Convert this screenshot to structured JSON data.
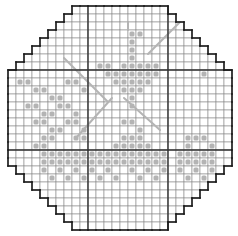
{
  "pattern": {
    "title": "Cross-stitch chart",
    "origin_x": 8,
    "origin_y": 6,
    "cell_size": 8,
    "cols": 28,
    "rows": 28,
    "corner_steps": 8,
    "major_cols": [
      10,
      20
    ],
    "major_rows": [
      8,
      18
    ],
    "colors": {
      "background": "#ffffff",
      "grid": "#8a8a8a",
      "major_grid": "#333333",
      "outline": "#1a1a1a",
      "stitch": "#b4b4b4"
    },
    "full_stitches": [
      [
        15,
        3
      ],
      [
        15,
        4
      ],
      [
        15,
        5
      ],
      [
        15,
        6
      ],
      [
        14,
        7
      ],
      [
        15,
        7
      ],
      [
        16,
        7
      ],
      [
        12,
        8
      ],
      [
        13,
        8
      ],
      [
        14,
        8
      ],
      [
        15,
        8
      ],
      [
        16,
        8
      ],
      [
        17,
        8
      ],
      [
        18,
        8
      ],
      [
        13,
        9
      ],
      [
        14,
        9
      ],
      [
        15,
        9
      ],
      [
        16,
        9
      ],
      [
        17,
        9
      ],
      [
        14,
        10
      ],
      [
        15,
        10
      ],
      [
        16,
        10
      ],
      [
        15,
        11
      ],
      [
        15,
        12
      ],
      [
        17,
        7
      ],
      [
        18,
        7
      ],
      [
        12,
        7
      ],
      [
        11,
        7
      ],
      [
        1,
        9
      ],
      [
        2,
        9
      ],
      [
        3,
        10
      ],
      [
        4,
        10
      ],
      [
        7,
        9
      ],
      [
        8,
        9
      ],
      [
        9,
        10
      ],
      [
        5,
        11
      ],
      [
        6,
        11
      ],
      [
        2,
        12
      ],
      [
        3,
        12
      ],
      [
        4,
        13
      ],
      [
        5,
        13
      ],
      [
        6,
        12
      ],
      [
        7,
        12
      ],
      [
        8,
        13
      ],
      [
        3,
        14
      ],
      [
        4,
        14
      ],
      [
        5,
        15
      ],
      [
        6,
        15
      ],
      [
        7,
        14
      ],
      [
        8,
        14
      ],
      [
        9,
        15
      ],
      [
        4,
        16
      ],
      [
        5,
        16
      ],
      [
        3,
        17
      ],
      [
        4,
        17
      ],
      [
        8,
        16
      ],
      [
        9,
        16
      ],
      [
        4,
        18
      ],
      [
        5,
        18
      ],
      [
        6,
        18
      ],
      [
        7,
        18
      ],
      [
        8,
        18
      ],
      [
        9,
        18
      ],
      [
        10,
        18
      ],
      [
        11,
        18
      ],
      [
        12,
        18
      ],
      [
        13,
        18
      ],
      [
        4,
        19
      ],
      [
        5,
        19
      ],
      [
        6,
        19
      ],
      [
        7,
        19
      ],
      [
        8,
        19
      ],
      [
        9,
        19
      ],
      [
        10,
        19
      ],
      [
        11,
        19
      ],
      [
        12,
        19
      ],
      [
        13,
        19
      ],
      [
        4,
        20
      ],
      [
        6,
        20
      ],
      [
        8,
        20
      ],
      [
        10,
        20
      ],
      [
        12,
        20
      ],
      [
        5,
        21
      ],
      [
        7,
        21
      ],
      [
        9,
        21
      ],
      [
        11,
        21
      ],
      [
        13,
        21
      ],
      [
        14,
        14
      ],
      [
        15,
        14
      ],
      [
        16,
        15
      ],
      [
        14,
        16
      ],
      [
        15,
        16
      ],
      [
        16,
        16
      ],
      [
        13,
        17
      ],
      [
        14,
        17
      ],
      [
        15,
        17
      ],
      [
        16,
        17
      ],
      [
        17,
        17
      ],
      [
        14,
        18
      ],
      [
        15,
        18
      ],
      [
        16,
        18
      ],
      [
        17,
        18
      ],
      [
        18,
        18
      ],
      [
        19,
        18
      ],
      [
        14,
        19
      ],
      [
        15,
        19
      ],
      [
        16,
        19
      ],
      [
        17,
        19
      ],
      [
        18,
        19
      ],
      [
        19,
        19
      ],
      [
        15,
        20
      ],
      [
        17,
        20
      ],
      [
        19,
        20
      ],
      [
        16,
        21
      ],
      [
        18,
        21
      ],
      [
        22,
        16
      ],
      [
        23,
        16
      ],
      [
        24,
        16
      ],
      [
        22,
        17
      ],
      [
        25,
        17
      ],
      [
        21,
        18
      ],
      [
        22,
        18
      ],
      [
        23,
        18
      ],
      [
        24,
        18
      ],
      [
        25,
        18
      ],
      [
        21,
        19
      ],
      [
        22,
        19
      ],
      [
        23,
        19
      ],
      [
        24,
        19
      ],
      [
        25,
        19
      ],
      [
        21,
        20
      ],
      [
        23,
        20
      ],
      [
        25,
        20
      ],
      [
        22,
        21
      ],
      [
        24,
        21
      ],
      [
        24,
        8
      ],
      [
        16,
        3
      ]
    ],
    "ray_lines": [
      [
        [
          7,
          6.5
        ],
        [
          12.5,
          12
        ]
      ],
      [
        [
          8.5,
          16.5
        ],
        [
          13,
          11.5
        ]
      ],
      [
        [
          15,
          2
        ],
        [
          15,
          3
        ]
      ],
      [
        [
          17.5,
          6
        ],
        [
          21.5,
          2
        ]
      ],
      [
        [
          14.5,
          11.5
        ],
        [
          19,
          15.5
        ]
      ],
      [
        [
          11,
          11
        ],
        [
          11,
          11
        ]
      ]
    ]
  }
}
